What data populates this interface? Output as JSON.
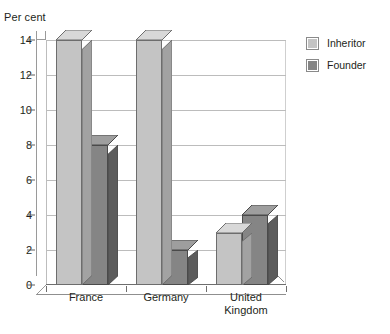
{
  "chart_data": {
    "type": "bar",
    "title": "",
    "subtitle": "",
    "xlabel": "",
    "ylabel": "Per cent",
    "ylim": [
      0,
      14
    ],
    "ytick_step": 2,
    "yticks": [
      "14",
      "12",
      "10",
      "8",
      "6",
      "4",
      "2",
      "0"
    ],
    "grid": true,
    "legend_position": "right",
    "style": "3d-columns",
    "categories": [
      "France",
      "Germany",
      "United\nKingdom"
    ],
    "series": [
      {
        "name": "Inheritor",
        "color": "#c4c4c4",
        "values": [
          14,
          14,
          3
        ]
      },
      {
        "name": "Founder",
        "color": "#858585",
        "values": [
          8,
          2,
          4
        ]
      }
    ]
  },
  "legend": {
    "items": [
      {
        "label": "Inheritor",
        "color": "#c4c4c4"
      },
      {
        "label": "Founder",
        "color": "#858585"
      }
    ]
  },
  "axis": {
    "y_title": "Per cent"
  }
}
